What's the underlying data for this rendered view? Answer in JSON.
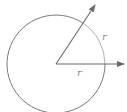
{
  "diagram": {
    "center": {
      "x": 56,
      "y": 64
    },
    "radius": 49,
    "angle_degrees": 57.3,
    "labels": {
      "radius_label": "r",
      "arc_label": "r"
    },
    "colors": {
      "circle": "#7a7a7a",
      "arc_highlight": "#b0b0b0",
      "arrows": "#6a6a6a",
      "labels": "#8a8a8a",
      "background": "#ffffff"
    }
  }
}
